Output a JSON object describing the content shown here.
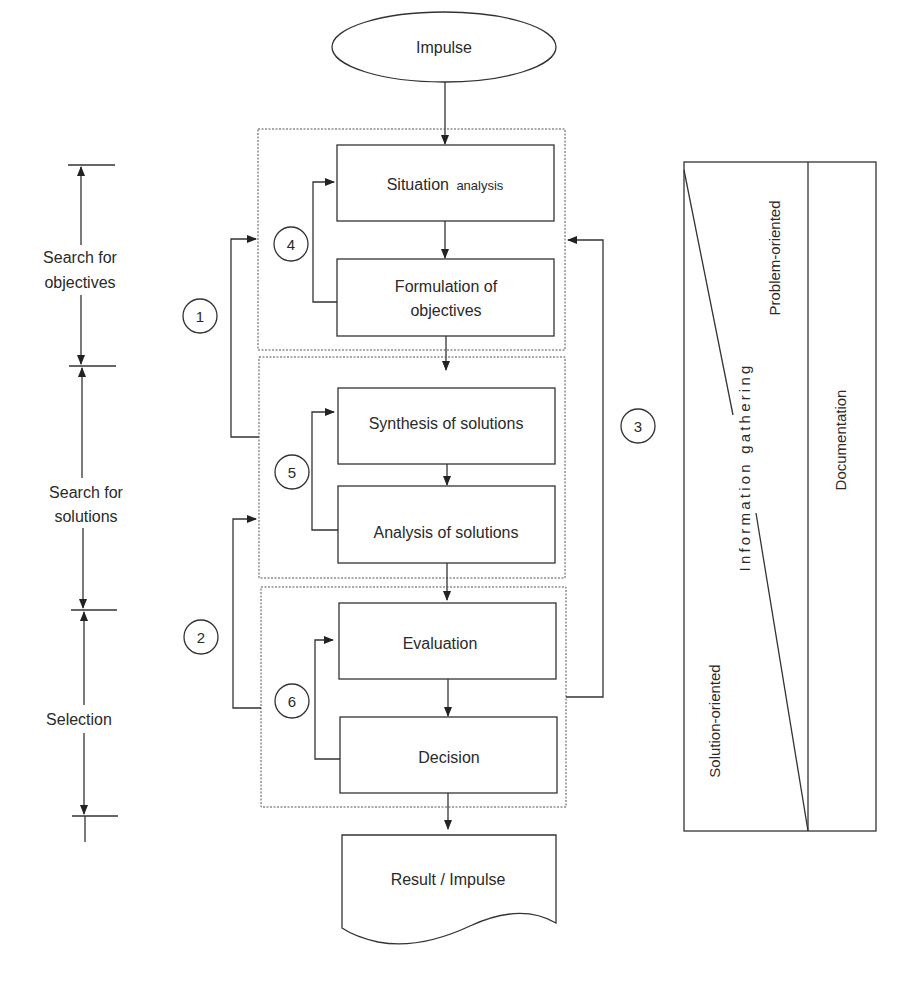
{
  "diagram": {
    "start": {
      "label": "Impulse",
      "shape": "ellipse"
    },
    "end": {
      "label": "Result / Impulse",
      "shape": "document"
    },
    "groups": [
      {
        "id": "group-objectives",
        "steps": [
          {
            "label_main": "Situation",
            "label_sub": "analysis"
          },
          {
            "line1": "Formulation of",
            "line2": "objectives"
          }
        ],
        "loop_number": "4"
      },
      {
        "id": "group-solutions",
        "steps": [
          {
            "label": "Synthesis of solutions"
          },
          {
            "label": "Analysis of solutions"
          }
        ],
        "loop_number": "5"
      },
      {
        "id": "group-selection",
        "steps": [
          {
            "label": "Evaluation"
          },
          {
            "label": "Decision"
          }
        ],
        "loop_number": "6"
      }
    ],
    "feedback_loops": [
      {
        "number": "1",
        "from": "group-solutions",
        "to": "group-objectives"
      },
      {
        "number": "2",
        "from": "group-selection",
        "to": "group-solutions"
      },
      {
        "number": "3",
        "from": "group-selection",
        "to": "group-objectives"
      }
    ],
    "phases": [
      {
        "line1": "Search for",
        "line2": "objectives"
      },
      {
        "line1": "Search for",
        "line2": "solutions"
      },
      {
        "line1": "Selection",
        "line2": ""
      }
    ],
    "side_panel": {
      "top_label": "Problem-oriented",
      "bottom_label": "Solution-oriented",
      "diagonal_label": "Information gathering",
      "right_column_label": "Documentation"
    }
  },
  "colors": {
    "line": "#333333",
    "text": "#2a2a2a",
    "background": "#ffffff"
  }
}
